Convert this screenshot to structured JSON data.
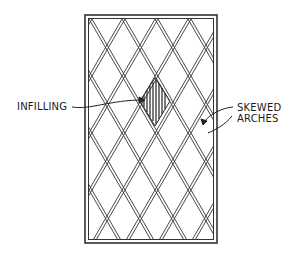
{
  "diagram": {
    "type": "lattice window with skewed arches",
    "labels": {
      "infilling": "INFILLING",
      "skewed_arches_line1": "SKEWED",
      "skewed_arches_line2": "ARCHES"
    },
    "frame": {
      "x": 85,
      "y": 15,
      "width": 132,
      "height": 228
    },
    "lattice": {
      "columns": 4,
      "rows": 4,
      "stroke_color": "#333333"
    },
    "infill_diamond": {
      "cx": 155,
      "cy": 100
    }
  }
}
